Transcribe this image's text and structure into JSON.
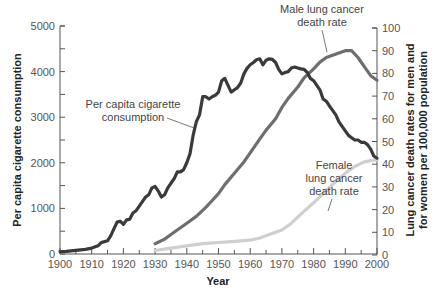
{
  "chart_data": {
    "type": "line",
    "title": "",
    "xlabel": "Year",
    "ylabel_left": "Per capita cigarette consumption",
    "ylabel_right": "Lung cancer death rates for men and for women per 100,000 population",
    "xlim": [
      1900,
      2000
    ],
    "ylim_left": [
      0,
      5000
    ],
    "ylim_right": [
      0,
      100
    ],
    "x_ticks": [
      1900,
      1910,
      1920,
      1930,
      1940,
      1950,
      1960,
      1970,
      1980,
      1990,
      2000
    ],
    "y_ticks_left": [
      0,
      1000,
      2000,
      3000,
      4000,
      5000
    ],
    "y_ticks_right": [
      0,
      10,
      20,
      30,
      40,
      50,
      60,
      70,
      80,
      90,
      100
    ],
    "grid": false,
    "legend": "inline annotations",
    "series": [
      {
        "name": "Per capita cigarette consumption",
        "axis": "left",
        "color": "#3a3a3a",
        "x": [
          1900,
          1902,
          1905,
          1908,
          1910,
          1912,
          1913,
          1915,
          1916,
          1917,
          1918,
          1919,
          1920,
          1921,
          1922,
          1923,
          1924,
          1925,
          1926,
          1927,
          1928,
          1929,
          1930,
          1931,
          1932,
          1933,
          1934,
          1935,
          1936,
          1937,
          1938,
          1939,
          1940,
          1941,
          1942,
          1943,
          1944,
          1945,
          1946,
          1947,
          1948,
          1949,
          1950,
          1951,
          1952,
          1953,
          1954,
          1955,
          1956,
          1957,
          1958,
          1959,
          1960,
          1961,
          1962,
          1963,
          1964,
          1965,
          1966,
          1967,
          1968,
          1969,
          1970,
          1971,
          1972,
          1973,
          1974,
          1975,
          1976,
          1977,
          1978,
          1979,
          1980,
          1981,
          1982,
          1983,
          1984,
          1985,
          1986,
          1987,
          1988,
          1989,
          1990,
          1991,
          1992,
          1993,
          1994,
          1995,
          1996,
          1997,
          1998,
          1999,
          2000
        ],
        "values": [
          54,
          60,
          80,
          100,
          130,
          180,
          250,
          290,
          400,
          550,
          700,
          720,
          650,
          750,
          760,
          900,
          950,
          1050,
          1150,
          1250,
          1300,
          1450,
          1480,
          1380,
          1250,
          1300,
          1450,
          1550,
          1650,
          1800,
          1800,
          1850,
          2000,
          2200,
          2600,
          2900,
          3050,
          3450,
          3450,
          3400,
          3450,
          3480,
          3550,
          3800,
          3850,
          3700,
          3550,
          3600,
          3650,
          3750,
          3950,
          4070,
          4150,
          4200,
          4260,
          4280,
          4150,
          4250,
          4280,
          4270,
          4200,
          4050,
          3950,
          3980,
          4000,
          4080,
          4100,
          4080,
          4060,
          4050,
          3980,
          3850,
          3800,
          3700,
          3600,
          3400,
          3350,
          3250,
          3150,
          3050,
          2900,
          2800,
          2700,
          2600,
          2550,
          2500,
          2500,
          2450,
          2450,
          2400,
          2300,
          2150,
          2100
        ]
      },
      {
        "name": "Male lung cancer death rate",
        "axis": "right",
        "color": "#6e6e6e",
        "x": [
          1930,
          1933,
          1936,
          1940,
          1943,
          1946,
          1948,
          1950,
          1952,
          1955,
          1958,
          1960,
          1963,
          1965,
          1968,
          1970,
          1972,
          1975,
          1977,
          1980,
          1982,
          1984,
          1986,
          1988,
          1990,
          1992,
          1994,
          1996,
          1998,
          2000
        ],
        "values": [
          5,
          7,
          10,
          14,
          17,
          21,
          24,
          27,
          31,
          36,
          41,
          45,
          51,
          55,
          60,
          65,
          69,
          74,
          78,
          82,
          85,
          87,
          88,
          89,
          90,
          90,
          87,
          83,
          79,
          77
        ]
      },
      {
        "name": "Female lung cancer death rate",
        "axis": "right",
        "color": "#cfcfcf",
        "x": [
          1930,
          1935,
          1940,
          1945,
          1950,
          1955,
          1960,
          1963,
          1966,
          1970,
          1973,
          1976,
          1980,
          1983,
          1986,
          1990,
          1993,
          1996,
          2000
        ],
        "values": [
          2,
          3,
          4,
          5,
          5.5,
          6,
          6.5,
          7.5,
          9,
          11,
          14,
          18,
          23,
          27,
          31,
          36,
          39,
          41,
          42
        ]
      }
    ],
    "annotations": [
      {
        "text": "Per capita cigarette consumption",
        "target_series": 0
      },
      {
        "text": "Male lung cancer death rate",
        "target_series": 1
      },
      {
        "text": "Female lung cancer death rate",
        "target_series": 2
      }
    ]
  },
  "labels": {
    "xlabel": "Year",
    "ylabel_left": "Per capita cigarette consumption",
    "ylabel_right_line1": "Lung cancer death rates for men and",
    "ylabel_right_line2": "for women per 100,000 population",
    "annot_cig_line1": "Per capita cigarette",
    "annot_cig_line2": "consumption",
    "annot_male_line1": "Male lung cancer",
    "annot_male_line2": "death rate",
    "annot_female_line1": "Female",
    "annot_female_line2": "lung cancer",
    "annot_female_line3": "death rate"
  }
}
